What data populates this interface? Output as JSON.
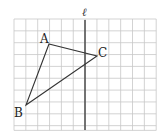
{
  "figure": {
    "grid": {
      "x0": 14,
      "y0": 19,
      "cols": 12,
      "rows": 9.4,
      "cell": 11.85,
      "line_color": "#c8c8c8"
    },
    "axis_line": {
      "label": "ℓ",
      "x": 85,
      "y_top": 20,
      "y_bottom": 130,
      "color": "#555555"
    },
    "triangle": {
      "stroke": "#333333",
      "vertices": [
        {
          "name": "A",
          "x": 49,
          "y": 44,
          "label_x": 40,
          "label_y": 43
        },
        {
          "name": "C",
          "x": 97,
          "y": 56,
          "label_x": 98,
          "label_y": 57
        },
        {
          "name": "B",
          "x": 26,
          "y": 105,
          "label_x": 14,
          "label_y": 117
        }
      ]
    }
  }
}
